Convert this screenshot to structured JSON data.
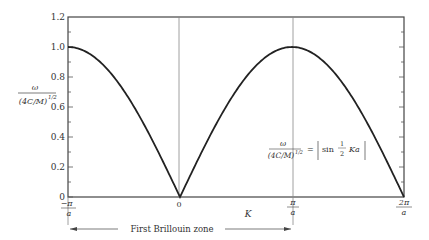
{
  "chart_data": {
    "type": "line",
    "title": "",
    "xlabel": "K",
    "ylabel": "ω / (4C/M)^1/2",
    "x_ticks": [
      {
        "value": -1,
        "label": "-π/a"
      },
      {
        "value": 0,
        "label": "0"
      },
      {
        "value": 1,
        "label": "π/a"
      },
      {
        "value": 2,
        "label": "2π/a"
      }
    ],
    "y_ticks": [
      0,
      0.2,
      0.4,
      0.6,
      0.8,
      1.0,
      1.2
    ],
    "y_tick_labels": [
      "0",
      "0.2",
      "0.4",
      "0.6",
      "0.8",
      "1.0",
      "1.2"
    ],
    "xlim": [
      -1,
      2
    ],
    "ylim": [
      0,
      1.2
    ],
    "grid": false,
    "x_unit": "π/a",
    "series": [
      {
        "name": "ω/(4C/M)^1/2 = |sin(½Ka)|",
        "x": [
          -1,
          -0.75,
          -0.5,
          -0.25,
          0,
          0.25,
          0.5,
          0.75,
          1,
          1.25,
          1.5,
          1.75,
          2
        ],
        "values": [
          1.0,
          0.924,
          0.707,
          0.383,
          0,
          0.383,
          0.707,
          0.924,
          1.0,
          0.924,
          0.707,
          0.383,
          0
        ]
      }
    ],
    "vertical_lines": [
      0,
      1
    ],
    "annotations": [
      {
        "text": "ω/(4C/M)^1/2 = |sin ½ Ka|",
        "position": "right of π/a line, mid-height"
      },
      {
        "text": "First Brillouin zone",
        "span": [
          -1,
          1
        ],
        "type": "double-arrow"
      }
    ]
  },
  "labels": {
    "y_label_num": "ω",
    "y_label_den": "(4C/M)",
    "y_label_exp": "1/2",
    "x_axis": "K",
    "tick_neg_pi_num": "π",
    "tick_neg_pi_den": "a",
    "tick_neg_sign": "−",
    "tick_zero": "0",
    "tick_pi_num": "π",
    "tick_pi_den": "a",
    "tick_2pi_num": "2π",
    "tick_2pi_den": "a",
    "eq_num": "ω",
    "eq_den": "(4C/M)",
    "eq_exp": "1/2",
    "eq_rhs_sin": "sin",
    "eq_rhs_half_num": "1",
    "eq_rhs_half_den": "2",
    "eq_rhs_ka": "Ka",
    "eq_equals": "=",
    "brillouin": "First Brillouin zone",
    "y0": "0",
    "y02": "0.2",
    "y04": "0.4",
    "y06": "0.6",
    "y08": "0.8",
    "y10": "1.0",
    "y12": "1.2"
  }
}
